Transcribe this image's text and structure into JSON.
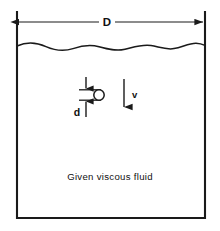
{
  "figure": {
    "type": "engineering-diagram",
    "caption": "Given  viscous  fluid",
    "labels": {
      "container_width": "D",
      "sphere_diameter": "d",
      "velocity": "v"
    },
    "colors": {
      "stroke": "#1a1a1a",
      "background": "#ffffff",
      "text": "#111111"
    },
    "geometry": {
      "container": {
        "left_wall_x": 17,
        "right_wall_x": 205,
        "top_y": 12,
        "bottom_y": 218
      },
      "fluid_surface_y": 46,
      "width_dimension_line_y": 22,
      "sphere": {
        "cx": 99,
        "cy": 95,
        "r": 5.2
      },
      "diameter_dimension_x": 86,
      "velocity_arrow_x": 124,
      "velocity_arrow_top_y": 79,
      "velocity_arrow_bottom_y": 108,
      "caption_y": 177
    }
  }
}
